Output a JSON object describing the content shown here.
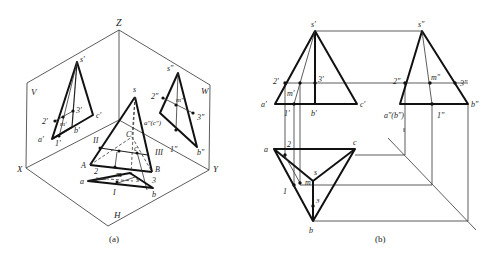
{
  "figure_a": {
    "caption": "(a)",
    "axis_labels": {
      "z": "Z",
      "x": "X",
      "y": "Y",
      "h": "H",
      "v": "V",
      "w": "W"
    },
    "v_projection_labels": {
      "s": "s′",
      "a": "a′",
      "b": "b′",
      "c": "c′",
      "p1": "1′",
      "p2": "2′",
      "p3": "3′",
      "m": "m′"
    },
    "w_projection_labels": {
      "s": "s″",
      "ac": "a″(c″)",
      "b": "b″",
      "p1": "1″",
      "p2": "2″",
      "p3": "3″",
      "m": "m″"
    },
    "pyramid_labels": {
      "s": "s",
      "A": "A",
      "B": "B",
      "C": "C",
      "c": "c",
      "II": "II",
      "III": "III",
      "I": "I",
      "a": "a",
      "b": "b",
      "m": "m",
      "p2": "2",
      "p3": "3",
      "s_low": "s"
    }
  },
  "figure_b": {
    "caption": "(b)",
    "front_view_labels": {
      "s": "s′",
      "a": "a′",
      "b": "b′",
      "c": "c′",
      "p1": "1′",
      "p2": "2′",
      "p3": "3′",
      "m": "m′"
    },
    "side_view_labels": {
      "s": "s″",
      "ab": "a″(b″)",
      "b": "b″",
      "p1": "1″",
      "p2": "2″",
      "p3": "3″",
      "m": "m″"
    },
    "top_view_labels": {
      "s": "s",
      "a": "a",
      "b": "b",
      "c": "c",
      "p1": "1",
      "p2": "2",
      "p3": "3",
      "m": "m"
    }
  }
}
